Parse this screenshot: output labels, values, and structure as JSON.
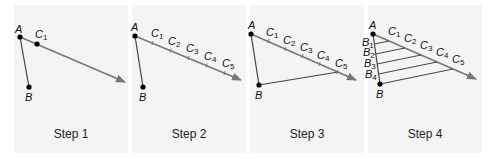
{
  "figure": {
    "colors": {
      "panel_bg": "#f4f4f4",
      "segment": "#444444",
      "ray": "#777777",
      "point": "#000000",
      "text": "#222222"
    },
    "steps": [
      {
        "caption": "Step 1",
        "labels": {
          "A": "A",
          "B": "B",
          "C1": "C1"
        }
      },
      {
        "caption": "Step 2",
        "labels": {
          "A": "A",
          "B": "B",
          "C": [
            "C1",
            "C2",
            "C3",
            "C4",
            "C5"
          ]
        }
      },
      {
        "caption": "Step 3",
        "labels": {
          "A": "A",
          "B": "B",
          "C": [
            "C1",
            "C2",
            "C3",
            "C4",
            "C5"
          ]
        }
      },
      {
        "caption": "Step 4",
        "labels": {
          "A": "A",
          "B": "B",
          "C": [
            "C1",
            "C2",
            "C3",
            "C4",
            "C5"
          ],
          "Bs": [
            "B1",
            "B2",
            "B3",
            "B4"
          ]
        }
      }
    ]
  }
}
